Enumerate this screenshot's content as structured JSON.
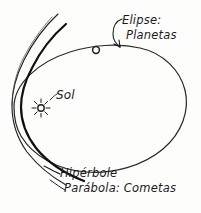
{
  "diagram": {
    "medium": "hand-drawn pencil sketch",
    "background_color": "#fdfdfc",
    "ink_color": "#1c1c1c",
    "labels": {
      "ellipse_line1": "Elipse:",
      "ellipse_line2": "Planetas",
      "sun": "Sol",
      "hyperbola": "Hipérbole",
      "parabola": "Parábola: Cometas"
    },
    "elements": {
      "ellipse_name": "ellipse-orbit",
      "hyperbola_name": "hyperbola-curve",
      "parabola_name": "parabola-curve",
      "sun_name": "sun-glyph",
      "planet_name": "planet-marker",
      "ellipse_arrow_name": "ellipse-leader-arrow",
      "hyperbola_leader_name": "hyperbola-leader-line",
      "parabola_leader_name": "parabola-leader-line"
    },
    "geometry": {
      "ellipse_center_x": 100,
      "ellipse_center_y": 105,
      "ellipse_radius_x": 86,
      "ellipse_radius_y": 62,
      "sun_x": 41,
      "sun_y": 108,
      "sun_radius": 3.2,
      "sun_ray_count": 8,
      "planet_x": 96,
      "planet_y": 50,
      "planet_radius": 3.4
    }
  }
}
